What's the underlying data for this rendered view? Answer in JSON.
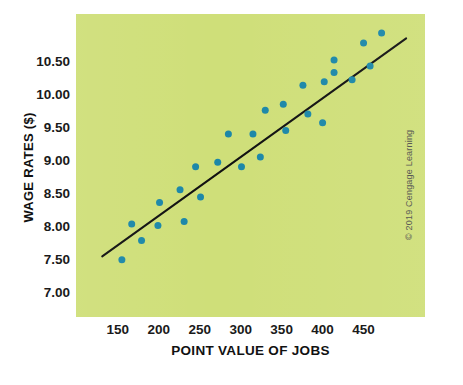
{
  "chart_data": {
    "type": "scatter",
    "title": "",
    "xlabel": "POINT VALUE OF JOBS",
    "ylabel": "WAGE RATES ($)",
    "xlim": [
      99,
      525
    ],
    "ylim": [
      6.62,
      11.22
    ],
    "xticks": [
      150,
      200,
      250,
      300,
      350,
      400,
      450
    ],
    "xtick_labels": [
      "150",
      "200",
      "250",
      "300",
      "350",
      "400",
      "450"
    ],
    "yticks": [
      7.0,
      7.5,
      8.0,
      8.5,
      9.0,
      9.5,
      10.0,
      10.5
    ],
    "ytick_labels": [
      "7.00",
      "7.50",
      "8.00",
      "8.50",
      "9.00",
      "9.50",
      "10.00",
      "10.50"
    ],
    "grid": false,
    "legend": null,
    "series": [
      {
        "name": "Job evaluation points vs wage rate",
        "type": "scatter",
        "marker_color": "#1b87a8",
        "marker_size": 7,
        "points": [
          {
            "x": 155,
            "y": 7.49
          },
          {
            "x": 167,
            "y": 8.03
          },
          {
            "x": 179,
            "y": 7.78
          },
          {
            "x": 201,
            "y": 8.36
          },
          {
            "x": 199,
            "y": 8.01
          },
          {
            "x": 226,
            "y": 8.55
          },
          {
            "x": 231,
            "y": 8.07
          },
          {
            "x": 245,
            "y": 8.9
          },
          {
            "x": 251,
            "y": 8.44
          },
          {
            "x": 272,
            "y": 8.97
          },
          {
            "x": 285,
            "y": 9.4
          },
          {
            "x": 301,
            "y": 8.9
          },
          {
            "x": 315,
            "y": 9.4
          },
          {
            "x": 324,
            "y": 9.05
          },
          {
            "x": 330,
            "y": 9.76
          },
          {
            "x": 352,
            "y": 9.85
          },
          {
            "x": 355,
            "y": 9.45
          },
          {
            "x": 376,
            "y": 10.14
          },
          {
            "x": 382,
            "y": 9.7
          },
          {
            "x": 400,
            "y": 9.57
          },
          {
            "x": 402,
            "y": 10.19
          },
          {
            "x": 414,
            "y": 10.52
          },
          {
            "x": 414,
            "y": 10.33
          },
          {
            "x": 436,
            "y": 10.22
          },
          {
            "x": 450,
            "y": 10.78
          },
          {
            "x": 458,
            "y": 10.43
          },
          {
            "x": 472,
            "y": 10.93
          }
        ]
      },
      {
        "name": "Wage trend line",
        "type": "line",
        "line_color": "#111111",
        "line_width": 2,
        "points": [
          {
            "x": 131,
            "y": 7.54
          },
          {
            "x": 502,
            "y": 10.85
          }
        ]
      }
    ],
    "annotations": []
  },
  "axes": {
    "panel_color": "#cfdf79",
    "tick_text_color": "#1a1a1a"
  },
  "credit": {
    "text": "© 2019 Cengage Learning"
  }
}
